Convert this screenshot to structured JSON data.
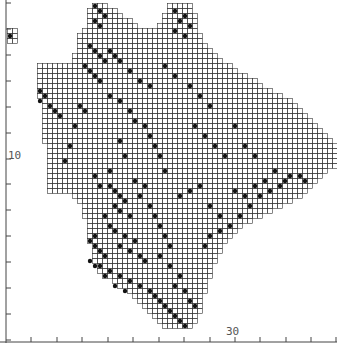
{
  "map": {
    "type": "grid distribution map",
    "cell_size": 5,
    "origin": [
      7,
      3
    ],
    "grid_color": "#333333",
    "fill_color": "#111111",
    "axis_color": "#444444",
    "y_axis": {
      "x": 6,
      "ticks_y": [
        3,
        29,
        55,
        81,
        107,
        133,
        159,
        184,
        210,
        236,
        262,
        288,
        314,
        340
      ],
      "label": "10",
      "label_y": 150
    },
    "x_axis": {
      "y": 342,
      "ticks_x": [
        31,
        57,
        82,
        108,
        133,
        159,
        184,
        210,
        235,
        260,
        286,
        311,
        336
      ],
      "label": "30",
      "label_x": 226
    },
    "rows": [
      [
        [
          17,
          19
        ],
        [
          32,
          36
        ]
      ],
      [
        [
          16,
          21
        ],
        [
          32,
          36
        ]
      ],
      [
        [
          16,
          22
        ],
        [
          31,
          37
        ]
      ],
      [
        [
          16,
          24
        ],
        [
          31,
          37
        ]
      ],
      [
        [
          16,
          25
        ],
        [
          30,
          37
        ]
      ],
      [
        [
          15,
          37
        ]
      ],
      [
        [
          14,
          38
        ]
      ],
      [
        [
          14,
          38
        ]
      ],
      [
        [
          14,
          39
        ]
      ],
      [
        [
          14,
          40
        ]
      ],
      [
        [
          13,
          41
        ]
      ],
      [
        [
          13,
          42
        ]
      ],
      [
        [
          6,
          44
        ]
      ],
      [
        [
          6,
          45
        ]
      ],
      [
        [
          6,
          47
        ]
      ],
      [
        [
          6,
          49
        ]
      ],
      [
        [
          6,
          50
        ]
      ],
      [
        [
          6,
          52
        ]
      ],
      [
        [
          6,
          54
        ]
      ],
      [
        [
          7,
          56
        ]
      ],
      [
        [
          7,
          57
        ]
      ],
      [
        [
          7,
          58
        ]
      ],
      [
        [
          7,
          59
        ]
      ],
      [
        [
          7,
          60
        ]
      ],
      [
        [
          7,
          61
        ]
      ],
      [
        [
          7,
          62
        ]
      ],
      [
        [
          7,
          63
        ]
      ],
      [
        [
          7,
          64
        ]
      ],
      [
        [
          8,
          65
        ]
      ],
      [
        [
          8,
          65
        ]
      ],
      [
        [
          8,
          65
        ]
      ],
      [
        [
          8,
          65
        ]
      ],
      [
        [
          8,
          65
        ]
      ],
      [
        [
          8,
          63
        ]
      ],
      [
        [
          8,
          62
        ]
      ],
      [
        [
          8,
          61
        ]
      ],
      [
        [
          8,
          60
        ]
      ],
      [
        [
          8,
          59
        ]
      ],
      [
        [
          13,
          58
        ]
      ],
      [
        [
          14,
          56
        ]
      ],
      [
        [
          15,
          54
        ]
      ],
      [
        [
          15,
          52
        ]
      ],
      [
        [
          15,
          50
        ]
      ],
      [
        [
          16,
          48
        ]
      ],
      [
        [
          16,
          46
        ]
      ],
      [
        [
          16,
          45
        ]
      ],
      [
        [
          16,
          44
        ]
      ],
      [
        [
          16,
          43
        ]
      ],
      [
        [
          17,
          42
        ]
      ],
      [
        [
          17,
          42
        ]
      ],
      [
        [
          17,
          41
        ]
      ],
      [
        [
          17,
          41
        ]
      ],
      [
        [
          18,
          40
        ]
      ],
      [
        [
          18,
          40
        ]
      ],
      [
        [
          19,
          40
        ]
      ],
      [
        [
          21,
          39
        ]
      ],
      [
        [
          22,
          39
        ]
      ],
      [
        [
          24,
          39
        ]
      ],
      [
        [
          25,
          38
        ]
      ],
      [
        [
          26,
          38
        ]
      ],
      [
        [
          27,
          38
        ]
      ],
      [
        [
          28,
          38
        ]
      ],
      [
        [
          29,
          37
        ]
      ],
      [
        [
          30,
          37
        ]
      ],
      [
        [
          31,
          36
        ]
      ]
    ],
    "islands": [
      [
        0,
        5
      ],
      [
        1,
        5
      ],
      [
        0,
        6
      ],
      [
        1,
        6
      ],
      [
        0,
        7
      ],
      [
        1,
        7
      ]
    ],
    "filled": [
      [
        0,
        6
      ],
      [
        17,
        0
      ],
      [
        18,
        1
      ],
      [
        19,
        2
      ],
      [
        17,
        3
      ],
      [
        18,
        4
      ],
      [
        33,
        1
      ],
      [
        34,
        3
      ],
      [
        35,
        2
      ],
      [
        36,
        4
      ],
      [
        33,
        5
      ],
      [
        35,
        6
      ],
      [
        16,
        8
      ],
      [
        17,
        9
      ],
      [
        18,
        10
      ],
      [
        19,
        11
      ],
      [
        15,
        12
      ],
      [
        16,
        13
      ],
      [
        17,
        14
      ],
      [
        18,
        15
      ],
      [
        20,
        9
      ],
      [
        21,
        10
      ],
      [
        22,
        11
      ],
      [
        24,
        13
      ],
      [
        26,
        15
      ],
      [
        28,
        16
      ],
      [
        31,
        12
      ],
      [
        33,
        14
      ],
      [
        36,
        16
      ],
      [
        38,
        18
      ],
      [
        40,
        20
      ],
      [
        6,
        17
      ],
      [
        7,
        18
      ],
      [
        6,
        19
      ],
      [
        8,
        20
      ],
      [
        9,
        21
      ],
      [
        10,
        22
      ],
      [
        14,
        20
      ],
      [
        15,
        21
      ],
      [
        13,
        24
      ],
      [
        12,
        28
      ],
      [
        11,
        31
      ],
      [
        20,
        18
      ],
      [
        22,
        19
      ],
      [
        24,
        21
      ],
      [
        25,
        23
      ],
      [
        27,
        24
      ],
      [
        28,
        26
      ],
      [
        29,
        28
      ],
      [
        30,
        30
      ],
      [
        31,
        33
      ],
      [
        22,
        27
      ],
      [
        23,
        30
      ],
      [
        20,
        33
      ],
      [
        17,
        34
      ],
      [
        18,
        36
      ],
      [
        25,
        35
      ],
      [
        27,
        36
      ],
      [
        26,
        38
      ],
      [
        28,
        40
      ],
      [
        29,
        42
      ],
      [
        30,
        44
      ],
      [
        31,
        46
      ],
      [
        32,
        48
      ],
      [
        34,
        38
      ],
      [
        36,
        37
      ],
      [
        38,
        36
      ],
      [
        40,
        40
      ],
      [
        42,
        42
      ],
      [
        20,
        36
      ],
      [
        21,
        37
      ],
      [
        22,
        38
      ],
      [
        23,
        39
      ],
      [
        21,
        40
      ],
      [
        22,
        41
      ],
      [
        24,
        42
      ],
      [
        19,
        42
      ],
      [
        20,
        44
      ],
      [
        21,
        45
      ],
      [
        23,
        46
      ],
      [
        25,
        47
      ],
      [
        22,
        48
      ],
      [
        24,
        49
      ],
      [
        26,
        50
      ],
      [
        27,
        51
      ],
      [
        19,
        50
      ],
      [
        18,
        52
      ],
      [
        20,
        53
      ],
      [
        22,
        54
      ],
      [
        24,
        55
      ],
      [
        26,
        56
      ],
      [
        28,
        57
      ],
      [
        29,
        58
      ],
      [
        30,
        59
      ],
      [
        31,
        60
      ],
      [
        32,
        61
      ],
      [
        33,
        62
      ],
      [
        34,
        63
      ],
      [
        35,
        64
      ],
      [
        17,
        46
      ],
      [
        16,
        47
      ],
      [
        17,
        48
      ],
      [
        18,
        49
      ],
      [
        16,
        51
      ],
      [
        17,
        52
      ],
      [
        19,
        54
      ],
      [
        21,
        56
      ],
      [
        23,
        57
      ],
      [
        30,
        50
      ],
      [
        32,
        52
      ],
      [
        34,
        54
      ],
      [
        33,
        56
      ],
      [
        35,
        57
      ],
      [
        36,
        59
      ],
      [
        37,
        60
      ],
      [
        39,
        48
      ],
      [
        40,
        46
      ],
      [
        42,
        45
      ],
      [
        44,
        44
      ],
      [
        46,
        42
      ],
      [
        48,
        40
      ],
      [
        50,
        38
      ],
      [
        52,
        37
      ],
      [
        54,
        36
      ],
      [
        55,
        35
      ],
      [
        56,
        34
      ],
      [
        58,
        34
      ],
      [
        59,
        35
      ],
      [
        45,
        37
      ],
      [
        47,
        38
      ],
      [
        49,
        36
      ],
      [
        51,
        35
      ],
      [
        53,
        33
      ],
      [
        43,
        30
      ],
      [
        41,
        28
      ],
      [
        39,
        26
      ],
      [
        37,
        24
      ],
      [
        45,
        24
      ],
      [
        47,
        28
      ],
      [
        49,
        30
      ]
    ]
  }
}
